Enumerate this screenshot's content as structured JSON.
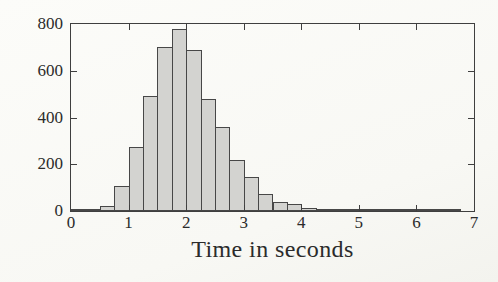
{
  "chart_data": {
    "type": "bar",
    "subtype": "histogram",
    "title": "",
    "xlabel": "Time in seconds",
    "ylabel": "",
    "xlim": [
      0,
      7
    ],
    "ylim": [
      0,
      800
    ],
    "x_ticks": [
      0,
      1,
      2,
      3,
      4,
      5,
      6,
      7
    ],
    "y_ticks": [
      0,
      200,
      400,
      600,
      800
    ],
    "bin_start": 0,
    "bin_width": 0.25,
    "values": [
      5,
      10,
      20,
      105,
      275,
      490,
      700,
      780,
      690,
      480,
      360,
      220,
      145,
      72,
      40,
      30,
      12,
      8,
      8,
      5,
      4,
      4,
      3,
      2,
      2,
      4,
      3,
      0
    ],
    "grid": false,
    "legend": null,
    "bar_fill": "#d3d3d0",
    "bar_stroke": "#474747",
    "axis_color": "#3f3f3f",
    "text_color": "#2b2b2b",
    "background": "#fbfbf8"
  }
}
